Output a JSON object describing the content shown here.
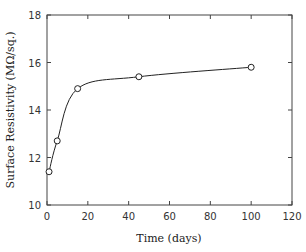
{
  "chart_data": {
    "type": "line",
    "title": "",
    "xlabel": "Time (days)",
    "ylabel": "Surface Resistivity (MΩ/sq.)",
    "xlim": [
      0,
      120
    ],
    "ylim": [
      10,
      18
    ],
    "xticks": [
      0,
      20,
      40,
      60,
      80,
      100,
      120
    ],
    "yticks": [
      10,
      12,
      14,
      16,
      18
    ],
    "grid": false,
    "legend": null,
    "series": [
      {
        "name": "Surface Resistivity",
        "marker": "open-circle",
        "line": "smooth",
        "x": [
          1,
          5,
          15,
          45,
          100
        ],
        "y": [
          11.4,
          12.7,
          14.9,
          15.4,
          15.8
        ]
      }
    ]
  },
  "labels": {
    "xlabel": "Time (days)",
    "ylabel": "Surface Resistivity (MΩ/sq.)",
    "xticks": [
      "0",
      "20",
      "40",
      "60",
      "80",
      "100",
      "120"
    ],
    "yticks": [
      "10",
      "12",
      "14",
      "16",
      "18"
    ]
  }
}
